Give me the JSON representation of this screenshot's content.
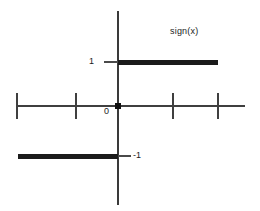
{
  "chart_data": {
    "type": "line",
    "title": "sign(x)",
    "xlabel": "",
    "ylabel": "",
    "xlim": [
      -2.4,
      2.9
    ],
    "ylim": [
      -2.1,
      2.2
    ],
    "grid": false,
    "legend": null,
    "legend_position": "top-right",
    "annotations": [
      {
        "text": "sign(x)",
        "role": "function-label",
        "x": 1.45,
        "y": 1.7
      }
    ],
    "y_tick_labels": [
      "1",
      "0",
      "-1"
    ],
    "y_tick_values": [
      1,
      0,
      -1
    ],
    "x_tick_labels": [
      "",
      "",
      "",
      ""
    ],
    "x_tick_values": [
      -2.2,
      -1.1,
      1.1,
      2.1
    ],
    "series": [
      {
        "name": "sign(x) negative branch",
        "values": [
          {
            "x": -2.2,
            "y": -1
          },
          {
            "x": 0,
            "y": -1
          }
        ]
      },
      {
        "name": "sign(x) positive branch",
        "values": [
          {
            "x": 0,
            "y": 1
          },
          {
            "x": 2.1,
            "y": 1
          }
        ]
      },
      {
        "name": "sign(0)",
        "values": [
          {
            "x": 0,
            "y": 0
          }
        ]
      }
    ]
  },
  "plot": {
    "title_label": "sign(x)",
    "label_one": "1",
    "label_zero": "0",
    "label_minus_one": "-1",
    "colors": {
      "background": "#ffffff",
      "axis": "#3f3f3f",
      "curve": "#1b1b1b",
      "text": "#1c1c1c"
    }
  }
}
